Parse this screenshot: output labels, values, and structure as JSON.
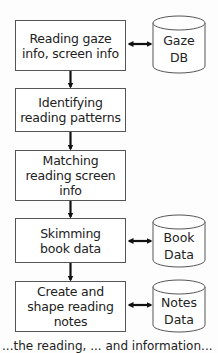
{
  "diagram": {
    "type": "flowchart",
    "process_steps": [
      {
        "id": "s1",
        "label": "Reading gaze\ninfo, screen info"
      },
      {
        "id": "s2",
        "label": "Identifying\nreading patterns"
      },
      {
        "id": "s3",
        "label": "Matching\nreading screen\ninfo"
      },
      {
        "id": "s4",
        "label": "Skimming\nbook data"
      },
      {
        "id": "s5",
        "label": "Create and\nshape reading\nnotes"
      }
    ],
    "data_stores": [
      {
        "id": "d1",
        "label": "Gaze\nDB",
        "connected_to": "s1"
      },
      {
        "id": "d2",
        "label": "Book\nData",
        "connected_to": "s4"
      },
      {
        "id": "d3",
        "label": "Notes\nData",
        "connected_to": "s5"
      }
    ],
    "edges": [
      {
        "from": "s1",
        "to": "s2",
        "type": "arrow"
      },
      {
        "from": "s2",
        "to": "s3",
        "type": "arrow"
      },
      {
        "from": "s3",
        "to": "s4",
        "type": "arrow"
      },
      {
        "from": "s4",
        "to": "s5",
        "type": "arrow"
      },
      {
        "from": "s1",
        "to": "d1",
        "type": "bidirectional"
      },
      {
        "from": "s4",
        "to": "d2",
        "type": "bidirectional"
      },
      {
        "from": "s5",
        "to": "d3",
        "type": "bidirectional"
      }
    ],
    "caption_partial": "...the reading, ... and information..."
  }
}
